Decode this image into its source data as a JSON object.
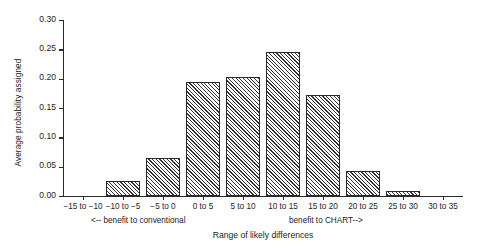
{
  "chart_data": {
    "type": "bar",
    "title": "",
    "xlabel": "Range of likely differences",
    "ylabel": "Average probability assigned",
    "categories": [
      "−15 to −10",
      "−10 to −5",
      "−5 to 0",
      "0 to 5",
      "5 to 10",
      "10 to 15",
      "15 to 20",
      "20 to 25",
      "25 to 30",
      "30 to 35"
    ],
    "values": [
      0.0,
      0.025,
      0.065,
      0.195,
      0.203,
      0.245,
      0.172,
      0.042,
      0.008,
      0.0
    ],
    "ylim": [
      0.0,
      0.3
    ],
    "yticks": [
      "0.00",
      "0.05",
      "0.10",
      "0.15",
      "0.20",
      "0.25",
      "0.30"
    ],
    "ytick_values": [
      0.0,
      0.05,
      0.1,
      0.15,
      0.2,
      0.25,
      0.3
    ],
    "grid": false,
    "legend": "none",
    "annotations": [
      "<-- benefit to conventional",
      "benefit to CHART-->"
    ]
  },
  "axis": {
    "y_title": "Average probability assigned",
    "x_title": "Range of likely differences"
  },
  "annotations": {
    "left": "<-- benefit to conventional",
    "right": "benefit to CHART-->"
  },
  "caption": ""
}
